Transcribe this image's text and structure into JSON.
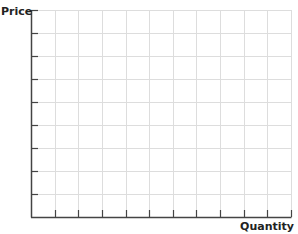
{
  "chart_data": {
    "type": "line",
    "title": "",
    "xlabel": "Quantity",
    "ylabel": "Price",
    "series": [],
    "x_divisions": 11,
    "y_divisions": 9,
    "grid": true,
    "legend": null,
    "note": "Blank graph grid with no plotted data, axes labeled Price and Quantity"
  },
  "colors": {
    "axis": "#444444",
    "grid": "#dddddd",
    "label": "#222222"
  }
}
